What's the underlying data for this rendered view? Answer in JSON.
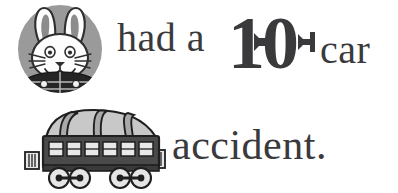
{
  "page": {
    "background_color": "#ffffff",
    "width": 398,
    "height": 193,
    "text_color": "#3a3a3c"
  },
  "sentence": {
    "full_text": "had a 10 car accident.",
    "line1": {
      "before_number": "had a",
      "number": "10",
      "number_digit_one": "1",
      "number_digit_zero": "0",
      "after_number": "car"
    },
    "line2": {
      "text": "accident."
    }
  },
  "illustrations": {
    "bunny": {
      "name": "bunny-head",
      "description": "gray oval with white rabbit head, long ears, whiskers and dark plaid collar",
      "circle_color": "#9a9a9a",
      "fur_color": "#fdfdfd",
      "outline_color": "#2f2f2f",
      "inner_ear_color": "#8c8c8c",
      "collar_color": "#262626"
    },
    "train_car": {
      "name": "passenger-train-car",
      "description": "dark gray passenger railway carriage with light roof, six windows, two bogies of two wheels",
      "body_color": "#4a4a4a",
      "roof_color": "#c8c8c8",
      "window_color": "#e8e8e8",
      "outline_color": "#1f1f1f",
      "window_count": 6,
      "wheel_count": 4,
      "roof_strap_count": 3
    }
  }
}
